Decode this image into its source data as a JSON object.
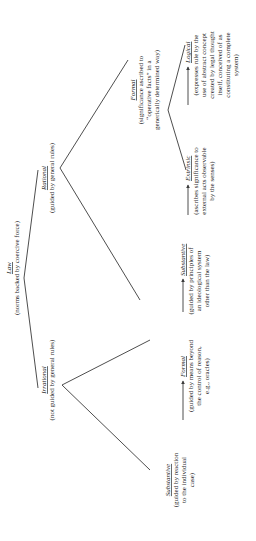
{
  "diagram": {
    "type": "tree",
    "orientation": "rotated-90-ccw",
    "root": {
      "title": "Law",
      "subtitle": "(norms backed by coercive force)"
    },
    "rational": {
      "title": "Rational",
      "subtitle": "(guided by general rules)",
      "formal": {
        "title": "Formal",
        "lines": [
          "(significance ascribed to",
          "“operative facts” in a",
          "generically determined way)"
        ],
        "logical": {
          "title": "Logical",
          "lines": [
            "(expresses rule by the",
            "use of abstract concept",
            "created by legal thought",
            "itself, conceived of as",
            "constituting a complete",
            "system)"
          ]
        },
        "extrinsic": {
          "title": "Extrinsic",
          "lines": [
            "(ascribes significance to",
            "external acts observable",
            "by the senses)"
          ]
        }
      },
      "substantive": {
        "title": "Substantive",
        "lines": [
          "(guided by principles of",
          "an ideological system",
          "other than the law)"
        ]
      }
    },
    "irrational": {
      "title": "Irrational",
      "subtitle": "(not guided by general rules)",
      "formal": {
        "title": "Formal",
        "lines": [
          "(guided by means beyond",
          "the control of reason,",
          "e.g., oracles)"
        ]
      },
      "substantive": {
        "title": "Substantive",
        "lines": [
          "(guided by reaction",
          "to the individual",
          "case)"
        ]
      }
    },
    "colors": {
      "line": "#3a3a3a",
      "text": "#2a2a2a",
      "background": "#ffffff"
    }
  }
}
